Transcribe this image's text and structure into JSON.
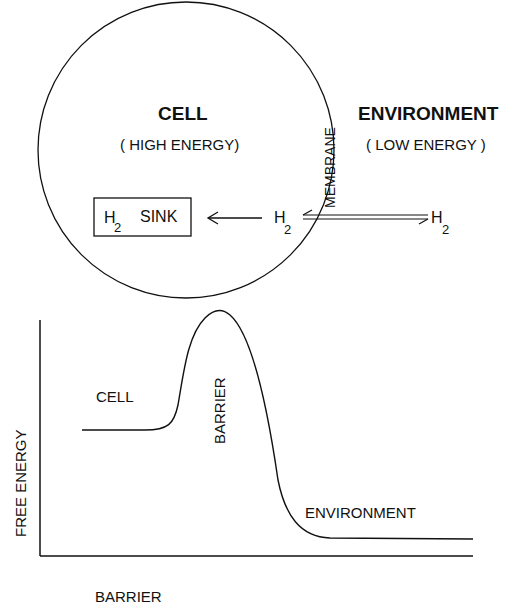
{
  "diagram": {
    "cell_title": "CELL",
    "cell_subtitle": "( HIGH ENERGY)",
    "env_title": "ENVIRONMENT",
    "env_subtitle": "( LOW ENERGY )",
    "membrane_label": "MEMBRANE",
    "sink_h": "H",
    "sink_sub": "2",
    "sink_label": "SINK",
    "h2_inside": "H",
    "h2_inside_sub": "2",
    "h2_outside": "H",
    "h2_outside_sub": "2"
  },
  "plot": {
    "y_axis_label": "FREE ENERGY",
    "x_axis_label": "BARRIER",
    "cell_label": "CELL",
    "barrier_label": "BARRIER",
    "environment_label": "ENVIRONMENT"
  },
  "colors": {
    "ink": "#111111",
    "background": "#ffffff"
  }
}
